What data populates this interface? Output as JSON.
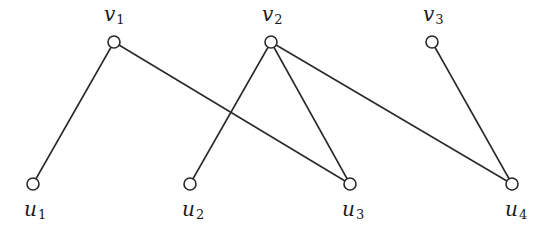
{
  "diagram": {
    "type": "bipartite-graph",
    "colors": {
      "stroke": "#2a2a2a",
      "node_fill": "#ffffff",
      "text": "#1a1a1a"
    },
    "node_radius": 6,
    "nodes": [
      {
        "id": "v1",
        "base": "v",
        "sub": "1",
        "x": 114,
        "y": 42,
        "label_x": 104,
        "label_y": 4,
        "row": "top"
      },
      {
        "id": "v2",
        "base": "v",
        "sub": "2",
        "x": 271,
        "y": 42,
        "label_x": 262,
        "label_y": 4,
        "row": "top"
      },
      {
        "id": "v3",
        "base": "v",
        "sub": "3",
        "x": 432,
        "y": 42,
        "label_x": 423,
        "label_y": 4,
        "row": "top"
      },
      {
        "id": "u1",
        "base": "u",
        "sub": "1",
        "x": 33,
        "y": 184,
        "label_x": 24,
        "label_y": 199,
        "row": "bottom"
      },
      {
        "id": "u2",
        "base": "u",
        "sub": "2",
        "x": 190,
        "y": 184,
        "label_x": 182,
        "label_y": 199,
        "row": "bottom"
      },
      {
        "id": "u3",
        "base": "u",
        "sub": "3",
        "x": 350,
        "y": 184,
        "label_x": 342,
        "label_y": 199,
        "row": "bottom"
      },
      {
        "id": "u4",
        "base": "u",
        "sub": "4",
        "x": 512,
        "y": 184,
        "label_x": 505,
        "label_y": 199,
        "row": "bottom"
      }
    ],
    "edges": [
      {
        "from": "v1",
        "to": "u1"
      },
      {
        "from": "v1",
        "to": "u3"
      },
      {
        "from": "v2",
        "to": "u2"
      },
      {
        "from": "v2",
        "to": "u3"
      },
      {
        "from": "v2",
        "to": "u4"
      },
      {
        "from": "v3",
        "to": "u4"
      }
    ]
  }
}
